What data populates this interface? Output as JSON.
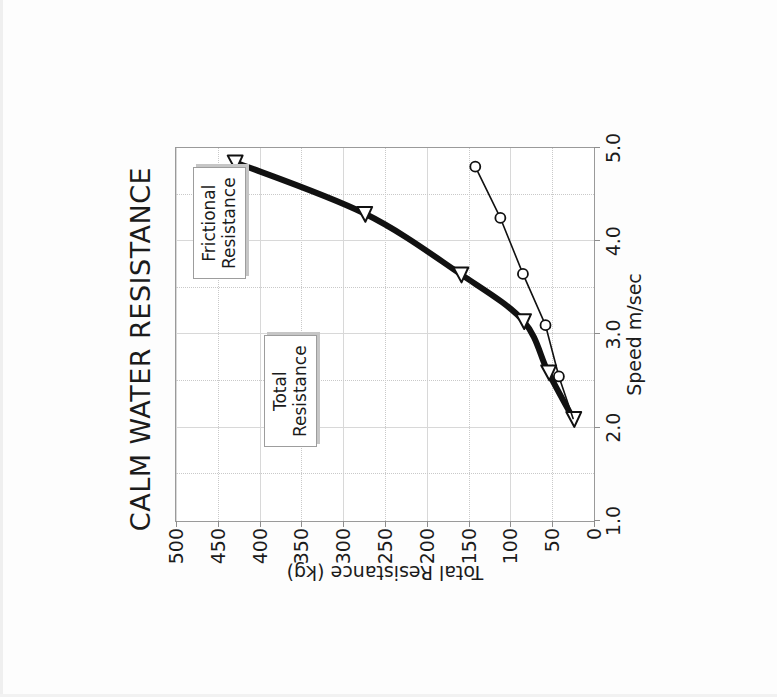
{
  "chart_data": {
    "type": "line",
    "title": "CALM WATER RESISTANCE",
    "xlabel": "Speed m/sec",
    "ylabel": "Total Resistance (kg)",
    "xlim": [
      1.0,
      5.0
    ],
    "ylim": [
      0,
      500
    ],
    "xticks": [
      "1.0",
      "2.0",
      "3.0",
      "4.0",
      "5.0"
    ],
    "xtick_values": [
      1.0,
      2.0,
      3.0,
      4.0,
      5.0
    ],
    "yticks": [
      "0",
      "50",
      "100",
      "150",
      "200",
      "250",
      "300",
      "350",
      "400",
      "450",
      "500"
    ],
    "ytick_values": [
      0,
      50,
      100,
      150,
      200,
      250,
      300,
      350,
      400,
      450,
      500
    ],
    "grid": true,
    "legend_position": "inside-annotations",
    "orientation_note": "chart rendered rotated 90 degrees clockwise on the scanned page",
    "series": [
      {
        "name": "Total Resistance",
        "marker": "triangle-open",
        "line_width": "thick",
        "color": "#111111",
        "points": [
          {
            "x": 2.1,
            "y": 25
          },
          {
            "x": 2.6,
            "y": 55
          },
          {
            "x": 3.15,
            "y": 85
          },
          {
            "x": 3.65,
            "y": 160
          },
          {
            "x": 4.3,
            "y": 275
          },
          {
            "x": 4.85,
            "y": 430
          }
        ]
      },
      {
        "name": "Frictional Resistance",
        "marker": "circle-open",
        "line_width": "thin",
        "color": "#111111",
        "points": [
          {
            "x": 2.1,
            "y": 25
          },
          {
            "x": 2.55,
            "y": 42
          },
          {
            "x": 3.1,
            "y": 58
          },
          {
            "x": 3.65,
            "y": 85
          },
          {
            "x": 4.25,
            "y": 112
          },
          {
            "x": 4.8,
            "y": 142
          }
        ]
      }
    ],
    "annotations": [
      {
        "id": "total-resistance",
        "text_line1": "Total",
        "text_line2": "Resistance"
      },
      {
        "id": "frictional-resistance",
        "text_line1": "Frictional",
        "text_line2": "Resistance"
      }
    ]
  },
  "annotations": {
    "total": {
      "line1": "Total",
      "line2": "Resistance"
    },
    "frictional": {
      "line1": "Frictional",
      "line2": "Resistance"
    }
  }
}
